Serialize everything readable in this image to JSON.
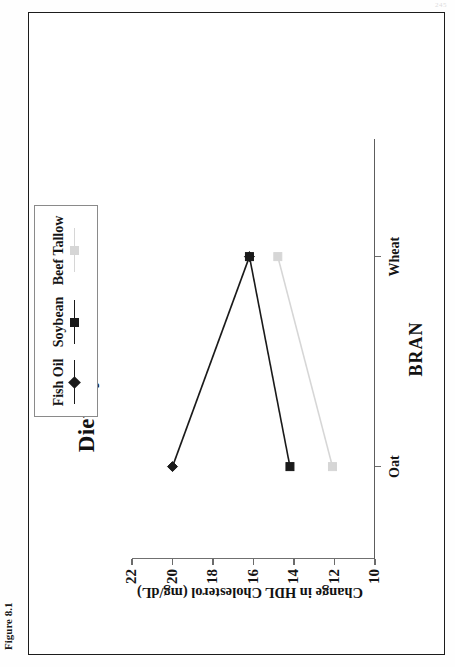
{
  "page": {
    "figure_caption": "Figure 8.1",
    "page_number": "245"
  },
  "chart_data": {
    "type": "line",
    "title": "Dietary Fibers and Oils",
    "xlabel": "BRAN",
    "ylabel": "Change in HDL Cholesterol (mg/dL)",
    "categories": [
      "Oat",
      "Wheat"
    ],
    "xtick_labels": [
      "Oat",
      "Wheat"
    ],
    "ytick_labels": [
      "22",
      "20",
      "18",
      "16",
      "14",
      "12",
      "10"
    ],
    "ylim": [
      10,
      22
    ],
    "ytick_values": [
      22,
      20,
      18,
      16,
      14,
      12,
      10
    ],
    "grid": false,
    "legend_position": "top-right",
    "series": [
      {
        "name": "Fish Oil",
        "values": [
          20.0,
          16.2
        ],
        "color": "#1a1a1a",
        "marker": "diamond"
      },
      {
        "name": "Soybean",
        "values": [
          14.2,
          16.2
        ],
        "color": "#1a1a1a",
        "marker": "square"
      },
      {
        "name": "Beef Tallow",
        "values": [
          12.1,
          14.8
        ],
        "color": "#d6d6d6",
        "marker": "square"
      }
    ]
  },
  "legend": {
    "items": [
      {
        "label": "Fish Oil",
        "color": "#1a1a1a",
        "marker": "diamond"
      },
      {
        "label": "Soybean",
        "color": "#1a1a1a",
        "marker": "square"
      },
      {
        "label": "Beef Tallow",
        "color": "#d6d6d6",
        "marker": "square"
      }
    ]
  }
}
